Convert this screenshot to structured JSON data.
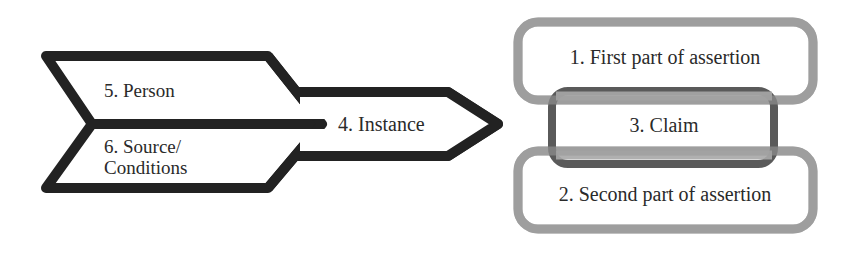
{
  "diagram": {
    "colors": {
      "background": "#ffffff",
      "arrow_stroke": "#222222",
      "assertion_stroke": "#9e9e9e",
      "claim_stroke": "#5a5a5a",
      "text": "#2a2a2a"
    },
    "arrow": {
      "upper_segment": {
        "label": "5. Person"
      },
      "lower_segment": {
        "label_line1": "6. Source/",
        "label_line2": "Conditions"
      },
      "tip_segment": {
        "label": "4. Instance"
      }
    },
    "assertion": {
      "first_part": {
        "label": "1. First part of assertion"
      },
      "claim": {
        "label": "3. Claim"
      },
      "second_part": {
        "label": "2. Second part of assertion"
      }
    }
  }
}
